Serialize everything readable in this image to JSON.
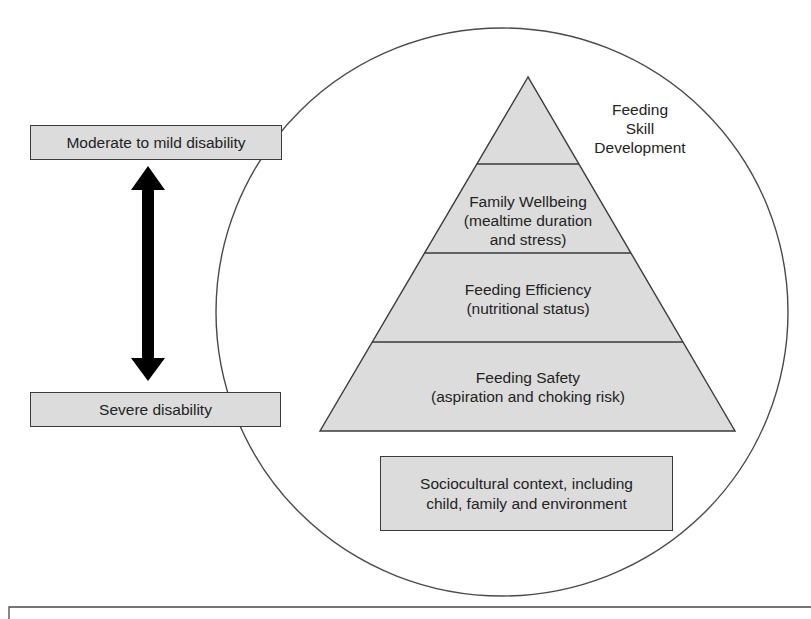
{
  "diagram": {
    "left_scale": {
      "top_label": "Moderate to mild disability",
      "bottom_label": "Severe disability",
      "arrow": "double-headed vertical arrow"
    },
    "pyramid": {
      "apex_label": {
        "line1": "Feeding",
        "line2": "Skill",
        "line3": "Development"
      },
      "levels": [
        {
          "line1": "Family Wellbeing",
          "line2": "(mealtime duration",
          "line3": "and stress)"
        },
        {
          "line1": "Feeding Efficiency",
          "line2": "(nutritional status)"
        },
        {
          "line1": "Feeding Safety",
          "line2": "(aspiration and choking risk)"
        }
      ]
    },
    "context_box": {
      "line1": "Sociocultural context, including",
      "line2": "child, family and environment"
    },
    "colors": {
      "fill": "#dcdcdc",
      "stroke": "#3a3a3a",
      "arrow": "#000000",
      "background": "#ffffff"
    }
  }
}
